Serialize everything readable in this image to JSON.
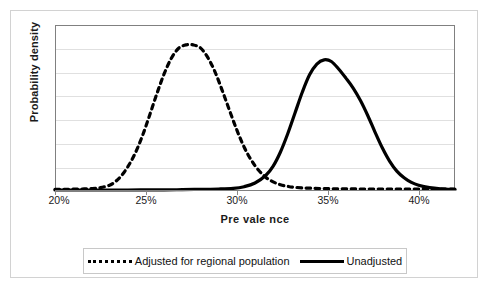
{
  "figure": {
    "background": "#ffffff",
    "frame_color": "#d2d2d2",
    "plot_border_color": "#808080",
    "grid_color": "#e0e0e0",
    "series_color": "#000000"
  },
  "axes": {
    "xtitle": "Pre vale nce",
    "ytitle": "Probability density",
    "xticks": [
      "20%",
      "25%",
      "30%",
      "35%",
      "40%"
    ]
  },
  "legend": {
    "items": [
      {
        "label": "Adjusted for regional population",
        "style": "dashed",
        "swatch": "dashed-line-swatch"
      },
      {
        "label": "Unadjusted",
        "style": "solid",
        "swatch": "solid-line-swatch"
      }
    ]
  },
  "chart_data": {
    "type": "line",
    "title": "",
    "subtitle": "",
    "xlabel": "Prevalence",
    "ylabel": "Probability density",
    "xlim": [
      20,
      42
    ],
    "ylim": [
      0,
      1
    ],
    "xticks": [
      20,
      25,
      30,
      35,
      40
    ],
    "xtick_labels": [
      "20%",
      "25%",
      "30%",
      "35%",
      "40%"
    ],
    "yticks": [],
    "ytick_labels": [],
    "grid": "horizontal",
    "gridline_count": 6,
    "legend_position": "bottom",
    "annotations": [],
    "series": [
      {
        "name": "Adjusted for regional population",
        "style": "dashed",
        "color": "#000000",
        "peak_x": 27.6,
        "peak_y": 0.88,
        "mean": 27.6,
        "sd": 1.45,
        "x": [
          20.0,
          20.5,
          21.0,
          21.5,
          22.0,
          22.5,
          23.0,
          23.3,
          23.6,
          24.0,
          24.4,
          24.8,
          25.2,
          25.6,
          26.0,
          26.4,
          26.8,
          27.2,
          27.6,
          28.0,
          28.4,
          28.8,
          29.2,
          29.6,
          30.0,
          30.4,
          30.8,
          31.2,
          31.6,
          32.0,
          32.4,
          32.8,
          33.2,
          34.0,
          35.0,
          36.0,
          37.0,
          38.0,
          39.0,
          40.0,
          41.0,
          42.0
        ],
        "y": [
          0.01,
          0.01,
          0.011,
          0.012,
          0.014,
          0.02,
          0.035,
          0.055,
          0.085,
          0.145,
          0.225,
          0.33,
          0.455,
          0.585,
          0.705,
          0.8,
          0.86,
          0.88,
          0.88,
          0.862,
          0.805,
          0.718,
          0.605,
          0.485,
          0.368,
          0.265,
          0.185,
          0.125,
          0.082,
          0.055,
          0.038,
          0.028,
          0.022,
          0.017,
          0.014,
          0.013,
          0.012,
          0.012,
          0.011,
          0.011,
          0.011,
          0.011
        ]
      },
      {
        "name": "Unadjusted",
        "style": "solid",
        "color": "#000000",
        "peak_x": 35.0,
        "peak_y": 0.79,
        "mean": 35.0,
        "sd": 1.7,
        "x": [
          20.0,
          22.0,
          24.0,
          26.0,
          27.0,
          28.0,
          29.0,
          29.8,
          30.4,
          31.0,
          31.6,
          32.0,
          32.4,
          32.8,
          33.2,
          33.6,
          34.0,
          34.4,
          34.8,
          35.2,
          35.6,
          36.0,
          36.4,
          36.8,
          37.2,
          37.6,
          38.0,
          38.4,
          38.8,
          39.2,
          39.6,
          40.0,
          40.6,
          41.2,
          42.0
        ],
        "y": [
          0.006,
          0.006,
          0.006,
          0.007,
          0.008,
          0.01,
          0.012,
          0.016,
          0.026,
          0.048,
          0.095,
          0.15,
          0.235,
          0.345,
          0.47,
          0.595,
          0.7,
          0.765,
          0.79,
          0.78,
          0.735,
          0.68,
          0.62,
          0.545,
          0.455,
          0.355,
          0.26,
          0.18,
          0.12,
          0.08,
          0.052,
          0.035,
          0.02,
          0.013,
          0.009
        ]
      }
    ]
  }
}
